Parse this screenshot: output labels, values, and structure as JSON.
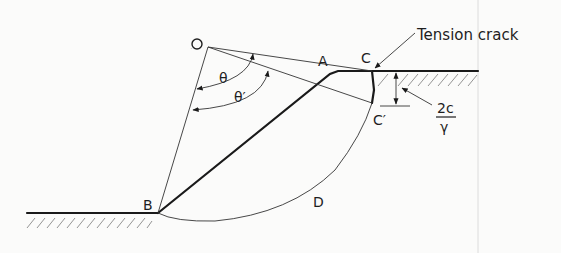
{
  "diagram": {
    "labels": {
      "O": "O",
      "A": "A",
      "B": "B",
      "C": "C",
      "C_prime": "C′",
      "D": "D",
      "theta": "θ",
      "theta_prime": "θ′",
      "tension_crack": "Tension crack",
      "crack_depth_num": "2c",
      "crack_depth_den": "γ"
    },
    "points": {
      "O": [
        208,
        47
      ],
      "A": [
        338,
        71
      ],
      "B": [
        158,
        213
      ],
      "C": [
        372,
        71
      ],
      "C_prime": [
        372,
        103
      ]
    },
    "colors": {
      "background": "#fbfbfa",
      "ink": "#1e1e1e",
      "hatch": "#888888"
    }
  }
}
